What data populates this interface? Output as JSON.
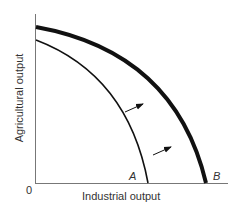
{
  "diagram": {
    "type": "production-possibility-frontier",
    "xlabel": "Industrial output",
    "ylabel": "Agricultural output",
    "origin_label": "0",
    "curves": [
      {
        "name": "A",
        "label": "A",
        "style": "thin"
      },
      {
        "name": "B",
        "label": "B",
        "style": "thick"
      }
    ],
    "annotation": "arrows indicate outward shift from A to B"
  }
}
